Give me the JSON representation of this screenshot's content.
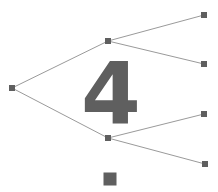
{
  "diagram": {
    "type": "binary-tree",
    "title_overlay": "4",
    "canvas": {
      "width": 218,
      "height": 192,
      "background": "#ffffff"
    },
    "colors": {
      "node_fill": "#5f5f5f",
      "edge_stroke": "#9a9a9a",
      "digit_fill": "#5f5f5f"
    },
    "nodes": [
      {
        "id": "root",
        "label": "root-node",
        "x": 12,
        "y": 88,
        "size": 6
      },
      {
        "id": "n-up",
        "label": "upper-branch-node",
        "x": 108,
        "y": 41,
        "size": 6
      },
      {
        "id": "n-dn",
        "label": "lower-branch-node",
        "x": 108,
        "y": 138,
        "size": 6
      },
      {
        "id": "leaf-1",
        "label": "leaf-node-1",
        "x": 204,
        "y": 15,
        "size": 6
      },
      {
        "id": "leaf-2",
        "label": "leaf-node-2",
        "x": 204,
        "y": 64,
        "size": 6
      },
      {
        "id": "leaf-3",
        "label": "leaf-node-3",
        "x": 204,
        "y": 114,
        "size": 6
      },
      {
        "id": "leaf-4",
        "label": "leaf-node-4",
        "x": 205,
        "y": 164,
        "size": 6
      },
      {
        "id": "detached",
        "label": "detached-square",
        "x": 110,
        "y": 179,
        "size": 13
      }
    ],
    "edges": [
      {
        "from": "root",
        "to": "n-up",
        "x1": 12,
        "y1": 88,
        "x2": 108,
        "y2": 41
      },
      {
        "from": "root",
        "to": "n-dn",
        "x1": 12,
        "y1": 88,
        "x2": 108,
        "y2": 138
      },
      {
        "from": "n-up",
        "to": "leaf-1",
        "x1": 108,
        "y1": 41,
        "x2": 204,
        "y2": 15
      },
      {
        "from": "n-up",
        "to": "leaf-2",
        "x1": 108,
        "y1": 41,
        "x2": 204,
        "y2": 64
      },
      {
        "from": "n-dn",
        "to": "leaf-3",
        "x1": 108,
        "y1": 138,
        "x2": 204,
        "y2": 114
      },
      {
        "from": "n-dn",
        "to": "leaf-4",
        "x1": 108,
        "y1": 138,
        "x2": 205,
        "y2": 164
      }
    ]
  }
}
